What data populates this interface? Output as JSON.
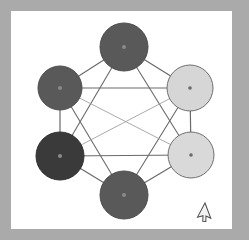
{
  "window": {
    "title": "Graph Visualization Canvas",
    "frame_color": "#aaaaaa",
    "canvas_color": "#ffffff"
  },
  "canvas": {
    "name": "node-link-diagram",
    "description": "Six circular nodes arranged in a hexagon connected by straight edges forming a hexagon perimeter and an inner hexagram star",
    "width": 221,
    "height": 218,
    "background": "#ffffff"
  },
  "palette": {
    "node_medium": "#595959",
    "node_dark": "#3a3a3a",
    "node_light": "#d6d6d6",
    "node_light_stroke": "#6f6f6f",
    "node_medium_stroke": "#4e4e4e",
    "edge_outer": "#6a6a6a",
    "edge_inner": "#9a9a9a",
    "center_dot_dark": "#8a8a8a",
    "center_dot_light": "#6a6a6a",
    "frame": "#aaaaaa",
    "cursor_fill": "#f2f2f2",
    "cursor_stroke": "#4a4a4a"
  },
  "nodes": [
    {
      "id": "n-top",
      "label": "top",
      "cx": 124,
      "cy": 47,
      "r": 24,
      "fill": "#595959",
      "stroke": "#4e4e4e",
      "dot": "#8a8a8a",
      "dot_r": 2.0
    },
    {
      "id": "n-upper-right",
      "label": "upper-right",
      "cx": 190,
      "cy": 88,
      "r": 23,
      "fill": "#d6d6d6",
      "stroke": "#6f6f6f",
      "dot": "#6a6a6a",
      "dot_r": 1.8
    },
    {
      "id": "n-lower-right",
      "label": "lower-right",
      "cx": 191,
      "cy": 155,
      "r": 23,
      "fill": "#d9d9d9",
      "stroke": "#6f6f6f",
      "dot": "#6a6a6a",
      "dot_r": 1.8
    },
    {
      "id": "n-bottom",
      "label": "bottom",
      "cx": 124,
      "cy": 195,
      "r": 24,
      "fill": "#595959",
      "stroke": "#4e4e4e",
      "dot": "#8a8a8a",
      "dot_r": 2.0
    },
    {
      "id": "n-lower-left",
      "label": "lower-left",
      "cx": 60,
      "cy": 156,
      "r": 24,
      "fill": "#3a3a3a",
      "stroke": "#313131",
      "dot": "#8a8a8a",
      "dot_r": 2.0
    },
    {
      "id": "n-upper-left",
      "label": "upper-left",
      "cx": 60,
      "cy": 88,
      "r": 22,
      "fill": "#595959",
      "stroke": "#4e4e4e",
      "dot": "#8a8a8a",
      "dot_r": 2.0
    }
  ],
  "edges": [
    {
      "id": "e-top-upper-right",
      "from": "n-top",
      "to": "n-upper-right",
      "kind": "outer",
      "color": "#6a6a6a",
      "width": 1.2
    },
    {
      "id": "e-upper-right-lower-right",
      "from": "n-upper-right",
      "to": "n-lower-right",
      "kind": "outer",
      "color": "#6a6a6a",
      "width": 1.2
    },
    {
      "id": "e-lower-right-bottom",
      "from": "n-lower-right",
      "to": "n-bottom",
      "kind": "outer",
      "color": "#6a6a6a",
      "width": 1.2
    },
    {
      "id": "e-bottom-lower-left",
      "from": "n-bottom",
      "to": "n-lower-left",
      "kind": "outer",
      "color": "#6a6a6a",
      "width": 1.2
    },
    {
      "id": "e-lower-left-upper-left",
      "from": "n-lower-left",
      "to": "n-upper-left",
      "kind": "outer",
      "color": "#6a6a6a",
      "width": 1.2
    },
    {
      "id": "e-upper-left-top",
      "from": "n-upper-left",
      "to": "n-top",
      "kind": "outer",
      "color": "#6a6a6a",
      "width": 1.2
    },
    {
      "id": "e-upper-left-upper-right",
      "from": "n-upper-left",
      "to": "n-upper-right",
      "kind": "chord",
      "color": "#6a6a6a",
      "width": 1.2
    },
    {
      "id": "e-lower-left-lower-right",
      "from": "n-lower-left",
      "to": "n-lower-right",
      "kind": "chord",
      "color": "#6a6a6a",
      "width": 1.2
    },
    {
      "id": "e-top-lower-left",
      "from": "n-top",
      "to": "n-lower-left",
      "kind": "star",
      "color": "#6a6a6a",
      "width": 1.1
    },
    {
      "id": "e-top-lower-right",
      "from": "n-top",
      "to": "n-lower-right",
      "kind": "star",
      "color": "#6a6a6a",
      "width": 1.1
    },
    {
      "id": "e-bottom-upper-left",
      "from": "n-bottom",
      "to": "n-upper-left",
      "kind": "star",
      "color": "#6a6a6a",
      "width": 1.1
    },
    {
      "id": "e-bottom-upper-right",
      "from": "n-bottom",
      "to": "n-upper-right",
      "kind": "star",
      "color": "#6a6a6a",
      "width": 1.1
    },
    {
      "id": "e-upper-left-lower-right",
      "from": "n-upper-left",
      "to": "n-lower-right",
      "kind": "inner",
      "color": "#a0a0a0",
      "width": 0.9
    },
    {
      "id": "e-lower-left-upper-right",
      "from": "n-lower-left",
      "to": "n-upper-right",
      "kind": "inner",
      "color": "#a0a0a0",
      "width": 0.9
    }
  ],
  "cursor": {
    "name": "mouse-pointer",
    "x": 205,
    "y": 203,
    "rotation_deg": 28
  }
}
